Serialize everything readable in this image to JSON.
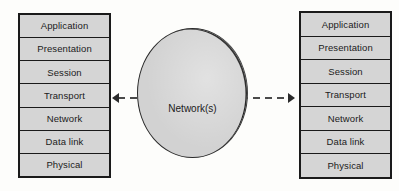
{
  "diagram": {
    "left_stack": {
      "name": "left-protocol-stack",
      "layers": [
        {
          "label": "Application"
        },
        {
          "label": "Presentation"
        },
        {
          "label": "Session"
        },
        {
          "label": "Transport"
        },
        {
          "label": "Network"
        },
        {
          "label": "Data link"
        },
        {
          "label": "Physical"
        }
      ]
    },
    "right_stack": {
      "name": "right-protocol-stack",
      "layers": [
        {
          "label": "Application"
        },
        {
          "label": "Presentation"
        },
        {
          "label": "Session"
        },
        {
          "label": "Transport"
        },
        {
          "label": "Network"
        },
        {
          "label": "Data link"
        },
        {
          "label": "Physical"
        }
      ]
    },
    "center": {
      "label": "Network(s)",
      "shape": "circle"
    },
    "connector": {
      "style": "dashed",
      "left_arrow": "◀",
      "right_arrow": "▶",
      "attaches_to_layer": "Transport"
    },
    "colors": {
      "layer_fill": "#d5d5d5",
      "cloud_fill": "#d2d2d2",
      "stroke": "#1a1a1a",
      "background": "#fdfdfb",
      "text": "#1b1b1b"
    }
  }
}
